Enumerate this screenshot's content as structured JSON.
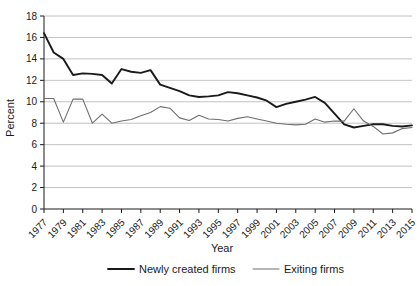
{
  "chart_data": {
    "type": "line",
    "title": "",
    "xlabel": "Year",
    "ylabel": "Percent",
    "ylim": [
      0,
      18
    ],
    "ytick_step": 2,
    "yticks": [
      "0",
      "2",
      "4",
      "6",
      "8",
      "10",
      "12",
      "14",
      "16",
      "18"
    ],
    "grid": true,
    "legend_position": "bottom",
    "x": [
      1977,
      1978,
      1979,
      1980,
      1981,
      1982,
      1983,
      1984,
      1985,
      1986,
      1987,
      1988,
      1989,
      1990,
      1991,
      1992,
      1993,
      1994,
      1995,
      1996,
      1997,
      1998,
      1999,
      2000,
      2001,
      2002,
      2003,
      2004,
      2005,
      2006,
      2007,
      2008,
      2009,
      2010,
      2011,
      2012,
      2013,
      2014,
      2015
    ],
    "xtick_labels": [
      "1977",
      "1979",
      "1981",
      "1983",
      "1985",
      "1987",
      "1989",
      "1991",
      "1993",
      "1995",
      "1997",
      "1999",
      "2001",
      "2003",
      "2005",
      "2007",
      "2009",
      "2011",
      "2013",
      "2015"
    ],
    "series": [
      {
        "name": "Newly created firms",
        "color": "#1a1a1a",
        "values": [
          16.4,
          14.6,
          14.0,
          12.5,
          12.65,
          12.6,
          12.5,
          11.7,
          13.05,
          12.8,
          12.7,
          12.95,
          11.6,
          11.3,
          11.0,
          10.6,
          10.45,
          10.5,
          10.6,
          10.9,
          10.8,
          10.6,
          10.4,
          10.1,
          9.5,
          9.8,
          10.0,
          10.2,
          10.45,
          9.9,
          8.9,
          7.9,
          7.6,
          7.75,
          7.9,
          7.9,
          7.75,
          7.7,
          7.8
        ]
      },
      {
        "name": "Exiting firms",
        "color": "#6e6e6e",
        "values": [
          10.3,
          10.3,
          8.1,
          10.25,
          10.25,
          8.0,
          8.85,
          8.0,
          8.2,
          8.35,
          8.7,
          9.0,
          9.55,
          9.4,
          8.5,
          8.25,
          8.75,
          8.4,
          8.35,
          8.2,
          8.45,
          8.6,
          8.4,
          8.2,
          8.0,
          7.9,
          7.85,
          7.9,
          8.4,
          8.1,
          8.2,
          8.2,
          9.35,
          8.2,
          7.7,
          7.0,
          7.1,
          7.5,
          7.6
        ]
      }
    ]
  },
  "legend": {
    "items": [
      {
        "label": "Newly created firms"
      },
      {
        "label": "Exiting firms"
      }
    ]
  },
  "axes": {
    "y_title": "Percent",
    "x_title": "Year"
  }
}
